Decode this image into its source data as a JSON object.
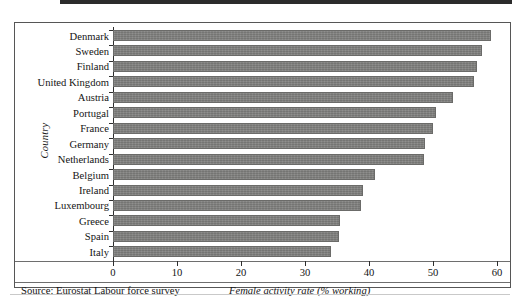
{
  "figure": {
    "y_axis_title": "Country",
    "x_axis_title": "Female activity rate (% working)",
    "source": "Source: Eurostat Labour force survey"
  },
  "chart_data": {
    "type": "bar",
    "orientation": "horizontal",
    "title": "",
    "xlabel": "Female activity rate (% working)",
    "ylabel": "Country",
    "xlim": [
      0,
      60
    ],
    "xticks": [
      0,
      10,
      20,
      30,
      40,
      50,
      60
    ],
    "xtick_labels": [
      "0",
      "10",
      "20",
      "30",
      "40",
      "50",
      "60"
    ],
    "grid": false,
    "legend": false,
    "bar_color": "#80807e",
    "categories": [
      "Denmark",
      "Sweden",
      "Finland",
      "United Kingdom",
      "Austria",
      "Portugal",
      "France",
      "Germany",
      "Netherlands",
      "Belgium",
      "Ireland",
      "Luxembourg",
      "Greece",
      "Spain",
      "Italy"
    ],
    "values": [
      59.0,
      57.7,
      56.8,
      56.4,
      53.2,
      50.5,
      50.0,
      48.8,
      48.6,
      41.0,
      39.0,
      38.8,
      35.5,
      35.3,
      34.0
    ]
  }
}
